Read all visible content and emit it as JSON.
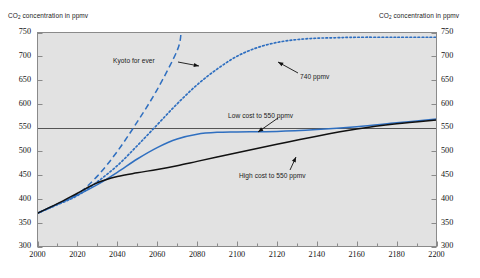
{
  "figure": {
    "clipped_title": "Carbon dioxide concentration projections to 2200, in ppmv",
    "left_axis_caption_pre": "CO",
    "left_axis_caption_sub": "2",
    "left_axis_caption_post": " concentration in ppmv",
    "right_axis_caption_pre": "CO",
    "right_axis_caption_sub": "2",
    "right_axis_caption_post": " concentration in ppmv",
    "plot_bg": "#e2e2e2",
    "frame_color": "#8a8a8a",
    "blue": "#2f6fc0",
    "black": "#111111",
    "ref_line_color": "#555555"
  },
  "chart_data": {
    "type": "line",
    "title": "",
    "xlabel": "",
    "ylabel": "CO2 concentration in ppmv",
    "xlim": [
      2000,
      2200
    ],
    "ylim": [
      300,
      750
    ],
    "xticks": [
      2000,
      2020,
      2040,
      2060,
      2080,
      2100,
      2120,
      2140,
      2160,
      2180,
      2200
    ],
    "xtick_labels": [
      "2000",
      "2020",
      "2040",
      "2060",
      "2080",
      "2100",
      "2120",
      "2140",
      "2160",
      "2180",
      "2200"
    ],
    "xminor_step": 10,
    "yticks": [
      300,
      350,
      400,
      450,
      500,
      550,
      600,
      650,
      700,
      750
    ],
    "ytick_labels": [
      "300",
      "350",
      "400",
      "450",
      "500",
      "550",
      "600",
      "650",
      "700",
      "750"
    ],
    "grid": false,
    "legend": "none",
    "reference_lines": [
      {
        "name": "550-ppmv-level",
        "y": 550,
        "style": "solid",
        "color": "#555555"
      }
    ],
    "series": [
      {
        "name": "Kyoto for ever",
        "style": "dashed",
        "color": "#2f6fc0",
        "x": [
          2000,
          2010,
          2020,
          2030,
          2040,
          2050,
          2060,
          2070,
          2072
        ],
        "y": [
          370,
          389,
          410,
          448,
          500,
          562,
          630,
          712,
          750
        ]
      },
      {
        "name": "740 ppmv",
        "style": "dotted",
        "color": "#2f6fc0",
        "x": [
          2000,
          2010,
          2020,
          2030,
          2040,
          2050,
          2060,
          2070,
          2080,
          2090,
          2100,
          2110,
          2120,
          2130,
          2140,
          2150,
          2160,
          2180,
          2200
        ],
        "y": [
          370,
          388,
          407,
          436,
          470,
          512,
          556,
          600,
          640,
          673,
          700,
          718,
          729,
          735,
          738,
          739,
          740,
          740,
          740
        ]
      },
      {
        "name": "Low cost to 550 ppmv",
        "style": "solid",
        "color": "#2f6fc0",
        "x": [
          2000,
          2010,
          2020,
          2030,
          2040,
          2050,
          2060,
          2070,
          2080,
          2090,
          2100,
          2120,
          2140,
          2160,
          2180,
          2200
        ],
        "y": [
          370,
          389,
          408,
          430,
          456,
          484,
          508,
          526,
          536,
          540,
          541,
          542,
          546,
          552,
          560,
          568
        ]
      },
      {
        "name": "High cost to 550 ppmv",
        "style": "solid",
        "color": "#111111",
        "x": [
          2000,
          2010,
          2020,
          2030,
          2040,
          2050,
          2060,
          2070,
          2080,
          2090,
          2100,
          2120,
          2140,
          2160,
          2180,
          2200
        ],
        "y": [
          370,
          390,
          412,
          434,
          447,
          455,
          462,
          470,
          479,
          488,
          497,
          515,
          532,
          547,
          558,
          566
        ]
      }
    ],
    "annotations": [
      {
        "name": "kyoto-for-ever",
        "text": "Kyoto for ever",
        "text_x": 113,
        "text_y": 57,
        "arrow_from": [
          178,
          62
        ],
        "arrow_to": [
          199,
          66
        ]
      },
      {
        "name": "740-ppmv",
        "text": "740 ppmv",
        "text_x": 300,
        "text_y": 73,
        "arrow_from": [
          298,
          73
        ],
        "arrow_to": [
          278,
          62
        ]
      },
      {
        "name": "low-cost-to-550-ppmv",
        "text": "Low cost to 550 ppmv",
        "text_x": 228,
        "text_y": 112,
        "arrow_from": [
          278,
          118
        ],
        "arrow_to": [
          258,
          132
        ]
      },
      {
        "name": "high-cost-to-550-ppmv",
        "text": "High cost to 550 ppmv",
        "text_x": 239,
        "text_y": 172,
        "arrow_from": [
          290,
          170
        ],
        "arrow_to": [
          296,
          157
        ]
      }
    ]
  }
}
